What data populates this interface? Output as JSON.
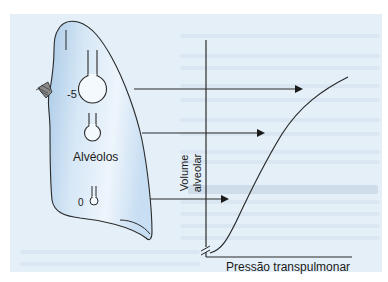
{
  "figure": {
    "type": "physiology-diagram",
    "lung": {
      "label": "Alvéolos",
      "alveoli": [
        {
          "position": "apex",
          "pressure_label": "-5",
          "size": "large"
        },
        {
          "position": "middle",
          "pressure_label": "",
          "size": "medium"
        },
        {
          "position": "base",
          "pressure_label": "0",
          "size": "small"
        }
      ]
    },
    "graph": {
      "x_axis_label": "Pressão transpulmonar",
      "y_axis_label_line1": "Volume",
      "y_axis_label_line2": "alveolar",
      "curve": "sigmoid pressure-volume curve",
      "axis_break": true,
      "arrows": [
        {
          "from": "apex alveolus",
          "to": "upper flat part of curve"
        },
        {
          "from": "middle alveolus",
          "to": "middle of curve"
        },
        {
          "from": "base alveolus",
          "to": "steep lower part of curve"
        }
      ]
    },
    "colors": {
      "panel_background": "#e4eff8",
      "lung_fill_light": "#e8f2fb",
      "lung_fill_dark": "#b7d3ec",
      "line": "#2a2a2a"
    }
  }
}
